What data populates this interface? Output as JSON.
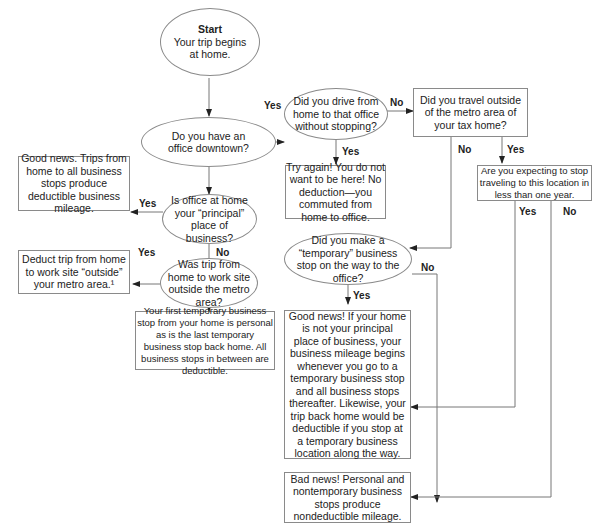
{
  "diagram": {
    "start": {
      "title": "Start",
      "text": "Your trip begins at home."
    },
    "q_office_downtown": "Do you have an office downtown?",
    "q_drive_without_stopping": "Did you drive from home to that office without stopping?",
    "q_travel_outside_metro": "Did you travel outside of the metro area of your tax home?",
    "q_expect_stop_year": "Are you expecting to stop traveling to this location in less than one year.",
    "r_try_again": "Try again! You do not want to be here! No deduction—you commuted from home to office.",
    "q_office_home_principal": "Is office at home your “principal” place of business?",
    "r_good_news_trips": "Good news. Trips from home to all business stops produce deductible business mileage.",
    "q_trip_outside_metro": "Was trip from home to work site outside the metro area?",
    "r_deduct_trip": "Deduct trip from home to work site “outside” your metro area.¹",
    "r_first_temp_stop": "Your first temporary business stop from your home is personal as is the last temporary business stop back home. All business stops in between are deductible.",
    "q_temporary_stop": "Did you make a “temporary” business stop on the way to the office?",
    "r_good_news_home": "Good news! If your home is not your principal place of business, your business mileage begins whenever you go to a temporary business stop and all business stops thereafter. Likewise, your trip back home would be deductible if you stop at a temporary business location along the way.",
    "r_bad_news": "Bad news! Personal and nontemporary business stops produce nondeductible mileage."
  },
  "edge_labels": {
    "yes": "Yes",
    "no": "No"
  },
  "colors": {
    "stroke": "#8a8a8a",
    "text": "#222222",
    "background": "#ffffff"
  }
}
